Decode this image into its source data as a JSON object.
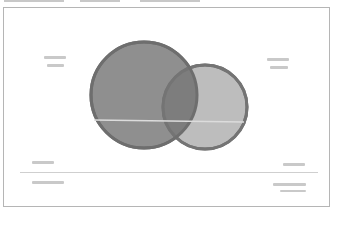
{
  "diagram": {
    "type": "venn",
    "sets": [
      {
        "name": "set-a",
        "cx": 144,
        "cy": 95,
        "r": 53,
        "fill": "#8f8f8f",
        "stroke": "#6e6e6e"
      },
      {
        "name": "set-b",
        "cx": 205,
        "cy": 107,
        "r": 42,
        "fill": "#bdbdbd",
        "stroke": "#747474"
      }
    ],
    "intersection_fill": "#7a7a7a",
    "midline_color": "#d9d9d9",
    "labels": {
      "top_left": [
        "",
        ""
      ],
      "top_right": [
        "",
        ""
      ],
      "bottom_left": [
        "",
        ""
      ],
      "bottom_right": [
        "",
        "",
        ""
      ]
    }
  }
}
